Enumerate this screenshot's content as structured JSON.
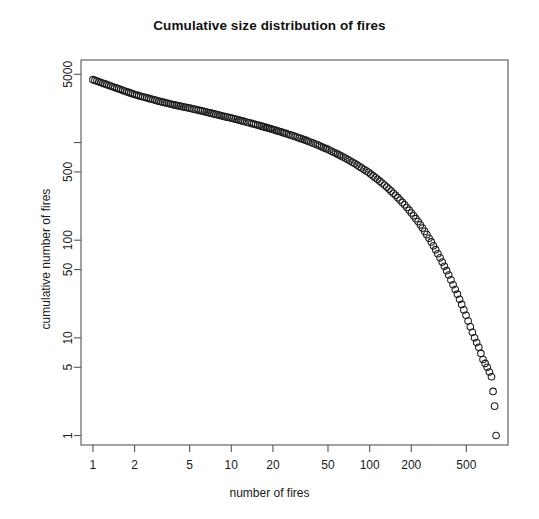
{
  "chart_data": {
    "type": "scatter",
    "title": "Cumulative size distribution of fires",
    "xlabel": "number of fires",
    "ylabel": "cumulative number of fires",
    "xscale": "log",
    "yscale": "log",
    "xlim": [
      0.82,
      1000
    ],
    "ylim": [
      0.8,
      7000
    ],
    "grid": false,
    "legend": null,
    "marker": "open-circle",
    "xticks": [
      1,
      2,
      5,
      10,
      20,
      50,
      100,
      200,
      500
    ],
    "xticklabels": [
      "1",
      "2",
      "5",
      "10",
      "20",
      "50",
      "100",
      "200",
      "500"
    ],
    "yticks": [
      1,
      5,
      10,
      50,
      100,
      500,
      1000,
      5000
    ],
    "yticklabels": [
      "1",
      "5",
      "10",
      "50",
      "100",
      "500",
      "",
      "5000"
    ],
    "x": [
      1,
      2,
      3,
      4,
      5,
      6,
      7,
      8,
      9,
      10,
      11,
      12,
      13,
      14,
      15,
      16,
      17,
      18,
      19,
      20,
      22,
      24,
      26,
      28,
      30,
      33,
      36,
      39,
      42,
      45,
      49,
      53,
      57,
      62,
      67,
      72,
      78,
      84,
      91,
      98,
      106,
      114,
      123,
      133,
      143,
      154,
      166,
      179,
      193,
      208,
      224,
      241,
      259,
      279,
      300,
      323,
      347,
      373,
      401,
      431,
      463,
      497,
      534,
      573,
      615,
      660,
      708,
      760,
      800,
      820
    ],
    "y": [
      4400,
      3100,
      2650,
      2400,
      2250,
      2120,
      2010,
      1920,
      1840,
      1780,
      1720,
      1665,
      1615,
      1570,
      1530,
      1490,
      1455,
      1420,
      1390,
      1360,
      1305,
      1255,
      1210,
      1170,
      1130,
      1080,
      1030,
      985,
      945,
      905,
      860,
      815,
      775,
      730,
      690,
      650,
      610,
      570,
      530,
      495,
      455,
      420,
      385,
      350,
      318,
      288,
      258,
      230,
      203,
      178,
      155,
      133,
      114,
      96,
      80,
      66,
      54,
      44,
      35,
      28,
      22,
      17,
      13,
      10,
      8,
      6,
      5,
      4,
      2,
      1
    ],
    "series_name": "cumulative fire size distribution",
    "n_points": 70
  }
}
